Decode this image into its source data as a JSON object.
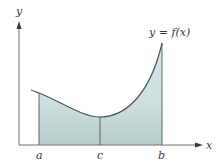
{
  "diagram": {
    "axes": {
      "x_label": "x",
      "y_label": "y"
    },
    "curve": {
      "label": "y = f(x)",
      "color": "#4a5a58"
    },
    "region": {
      "fill_color": "#c9dcdc",
      "fill_color_bottom": "#b9cfcf"
    },
    "points": [
      {
        "name": "a",
        "label": "a"
      },
      {
        "name": "c",
        "label": "c"
      },
      {
        "name": "b",
        "label": "b"
      }
    ]
  }
}
